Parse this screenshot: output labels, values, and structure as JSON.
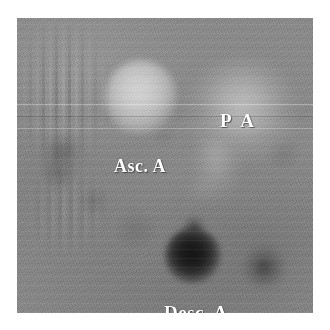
{
  "viewer": {
    "name": "axial-chest-scan-viewer",
    "background_color": "#ffffff"
  },
  "scan": {
    "modality": "grayscale axial cross-sectional chest scan",
    "frame": {
      "left": 17,
      "top": 18,
      "width": 296,
      "height": 295
    },
    "base_tone": "#858585",
    "brightest_tone": "#c8c8c8",
    "darkest_tone": "#1a1a1a",
    "artifacts": {
      "vertical_ghosting": "left-side phase-encode striping",
      "horizontal_scan_lines": "faint raster banding across full width"
    }
  },
  "structures": [
    {
      "key": "ascending-aorta",
      "label": "Asc. A",
      "appearance": "bright round lumen",
      "center": [
        141,
        99
      ],
      "radius": 36,
      "tone": "#c8c8c8"
    },
    {
      "key": "pulmonary-artery",
      "label": "P A",
      "appearance": "diffuse brighter region",
      "center": [
        240,
        112
      ],
      "radius": 54,
      "tone": "#aeaeae"
    },
    {
      "key": "descending-aorta",
      "label": "Desc. A",
      "appearance": "dark round lumen",
      "center": [
        193,
        256
      ],
      "radius": 28,
      "tone": "#1a1a1a"
    },
    {
      "key": "hemiazygos-vein",
      "label": "",
      "appearance": "small dark rounded region",
      "center": [
        264,
        267
      ],
      "radius": 21,
      "tone": "#3c3c3c"
    }
  ],
  "annotations": {
    "pa": {
      "text": "P A",
      "color": "#ffffff",
      "position": [
        203,
        93
      ]
    },
    "asc_a": {
      "text": "Asc. A",
      "color": "#ffffff",
      "position": [
        97,
        139
      ]
    },
    "desc_a": {
      "text": "Desc. A",
      "color": "#ffffff",
      "position": [
        147,
        285
      ]
    }
  }
}
